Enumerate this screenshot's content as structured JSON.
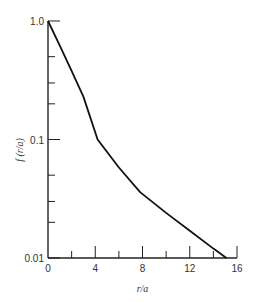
{
  "chart_data": {
    "type": "line",
    "title": "",
    "xlabel": "r/a",
    "ylabel": "f (r/a)",
    "xlim": [
      0,
      16
    ],
    "ylim": [
      0.01,
      1.0
    ],
    "yscale": "log",
    "grid": false,
    "legend": null,
    "x_ticks_major": [
      0,
      4,
      8,
      12,
      16
    ],
    "x_tick_labels": [
      "0",
      "4",
      "8",
      "12",
      "16"
    ],
    "x_ticks_minor": [
      2,
      6,
      10,
      14
    ],
    "y_ticks_major": [
      1.0,
      0.1,
      0.01
    ],
    "y_tick_labels": [
      "1.0",
      "0.1",
      "0.01"
    ],
    "y_ticks_minor": [
      0.5,
      0.3,
      0.2,
      0.05,
      0.03,
      0.02
    ],
    "series": [
      {
        "name": "f(r/a)",
        "x": [
          0,
          1,
          2,
          3,
          4.2,
          6,
          7.8,
          10,
          12,
          14,
          15.1
        ],
        "y": [
          1.0,
          0.62,
          0.38,
          0.23,
          0.1,
          0.058,
          0.036,
          0.024,
          0.017,
          0.012,
          0.01
        ]
      }
    ]
  }
}
